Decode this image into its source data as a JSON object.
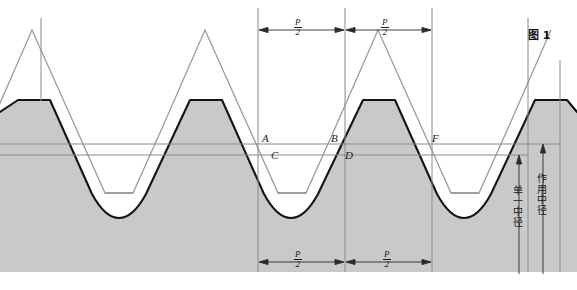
{
  "figure": {
    "caption": "图 1",
    "caption_x": 528,
    "caption_y": 32
  },
  "colors": {
    "background": "#ffffff",
    "material_fill": "#c9c9c9",
    "actual_profile_stroke": "#151515",
    "ideal_profile_stroke": "#9b9b9b",
    "thin_line": "#8a8a8a",
    "dimension_line": "#2b2b2b",
    "text": "#1a1a1a"
  },
  "geometry": {
    "pitch_px": 172,
    "peak_xs": [
      33,
      205,
      378,
      550
    ],
    "crest_y": 100,
    "root_y": 216,
    "body_bottom_y": 272,
    "line_A_y": 144,
    "line_C_y": 155
  },
  "point_labels": [
    {
      "name": "point-a",
      "text": "A",
      "x": 262,
      "y": 133
    },
    {
      "name": "point-b",
      "text": "B",
      "x": 331,
      "y": 133
    },
    {
      "name": "point-f",
      "text": "F",
      "x": 432,
      "y": 133
    },
    {
      "name": "point-c",
      "text": "C",
      "x": 271,
      "y": 150
    },
    {
      "name": "point-d",
      "text": "D",
      "x": 345,
      "y": 150
    }
  ],
  "dimensions": {
    "top": {
      "y": 30,
      "left_tick_x": 258,
      "mid_tick_x": 345,
      "right_tick_x": 432,
      "segments": [
        {
          "name": "top-left-half-pitch",
          "numerator": "P",
          "denominator": "2",
          "label_x": 299,
          "label_y": 20
        },
        {
          "name": "top-right-half-pitch",
          "numerator": "P",
          "denominator": "2",
          "label_x": 386,
          "label_y": 20
        }
      ],
      "extension_top_y": 8,
      "extension_bottom_y": 48
    },
    "bottom": {
      "y": 262,
      "left_tick_x": 258,
      "mid_tick_x": 345,
      "right_tick_x": 432,
      "segments": [
        {
          "name": "bottom-left-half-pitch",
          "numerator": "P",
          "denominator": "2",
          "label_x": 299,
          "label_y": 252
        },
        {
          "name": "bottom-right-half-pitch",
          "numerator": "P",
          "denominator": "2",
          "label_x": 388,
          "label_y": 252
        }
      ],
      "extension_top_y": 236,
      "extension_bottom_y": 272
    }
  },
  "vertical_callouts": [
    {
      "name": "single-pitch-diameter",
      "text": "单一中径",
      "arrow_x": 519,
      "arrow_top_y": 156,
      "arrow_bottom_y": 274,
      "label_x": 513,
      "label_y": 186
    },
    {
      "name": "functional-pitch-diameter",
      "text": "作用中径",
      "arrow_x": 543,
      "arrow_top_y": 144,
      "arrow_bottom_y": 274,
      "label_x": 537,
      "label_y": 176
    }
  ]
}
